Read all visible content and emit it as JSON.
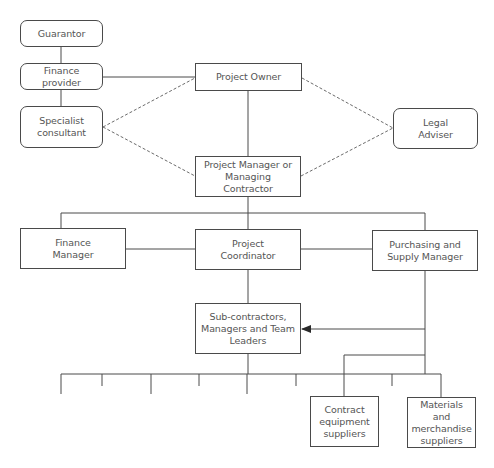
{
  "diagram": {
    "title": "",
    "colors": {
      "line": "#4a4a4a",
      "text": "#555555",
      "background": "#ffffff"
    },
    "nodes": {
      "guarantor": {
        "label": "Guarantor",
        "shape": "rounded"
      },
      "finance_provider": {
        "label": "Finance provider",
        "shape": "rounded"
      },
      "specialist_consultant": {
        "label": "Specialist\nconsultant",
        "shape": "rounded"
      },
      "project_owner": {
        "label": "Project Owner",
        "shape": "rect"
      },
      "legal_adviser": {
        "label": "Legal\nAdviser",
        "shape": "rounded"
      },
      "project_manager": {
        "label": "Project Manager or\nManaging Contractor",
        "shape": "rect"
      },
      "finance_manager": {
        "label": "Finance\nManager",
        "shape": "rect"
      },
      "project_coordinator": {
        "label": "Project\nCoordinator",
        "shape": "rect"
      },
      "purchasing_manager": {
        "label": "Purchasing and\nSupply Manager",
        "shape": "rect"
      },
      "subcontractors": {
        "label": "Sub-contractors,\nManagers and Team\nLeaders",
        "shape": "rect"
      },
      "contract_equipment": {
        "label": "Contract\nequipment\nsuppliers",
        "shape": "rect"
      },
      "materials_suppliers": {
        "label": "Materials and\nmerchandise\nsuppliers",
        "shape": "rect"
      }
    },
    "edges": [
      {
        "from": "guarantor",
        "to": "finance_provider",
        "style": "solid"
      },
      {
        "from": "finance_provider",
        "to": "specialist_consultant",
        "style": "solid"
      },
      {
        "from": "finance_provider",
        "to": "project_owner",
        "style": "solid"
      },
      {
        "from": "specialist_consultant",
        "to": "project_owner",
        "style": "dashed"
      },
      {
        "from": "specialist_consultant",
        "to": "project_manager",
        "style": "dashed"
      },
      {
        "from": "project_owner",
        "to": "legal_adviser",
        "style": "dashed"
      },
      {
        "from": "project_manager",
        "to": "legal_adviser",
        "style": "dashed"
      },
      {
        "from": "project_owner",
        "to": "project_manager",
        "style": "solid"
      },
      {
        "from": "project_manager",
        "to": "finance_manager",
        "style": "solid"
      },
      {
        "from": "project_manager",
        "to": "project_coordinator",
        "style": "solid"
      },
      {
        "from": "project_manager",
        "to": "purchasing_manager",
        "style": "solid"
      },
      {
        "from": "finance_manager",
        "to": "project_coordinator",
        "style": "solid"
      },
      {
        "from": "project_coordinator",
        "to": "purchasing_manager",
        "style": "solid"
      },
      {
        "from": "project_coordinator",
        "to": "subcontractors",
        "style": "solid"
      },
      {
        "from": "purchasing_manager",
        "to": "subcontractors",
        "style": "arrow"
      },
      {
        "from": "purchasing_manager",
        "to": "contract_equipment",
        "style": "solid"
      },
      {
        "from": "subcontractors",
        "to": "materials_suppliers",
        "style": "solid"
      }
    ],
    "bottom_branch_ticks": 9
  }
}
